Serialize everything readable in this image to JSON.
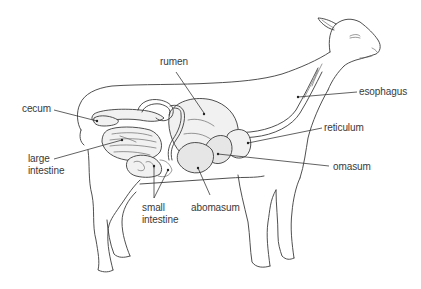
{
  "diagram": {
    "labels": [
      {
        "id": "rumen",
        "text": "rumen"
      },
      {
        "id": "esophagus",
        "text": "esophagus"
      },
      {
        "id": "cecum",
        "text": "cecum"
      },
      {
        "id": "reticulum",
        "text": "reticulum"
      },
      {
        "id": "large_intestine_1",
        "text": "large"
      },
      {
        "id": "large_intestine_2",
        "text": "intestine"
      },
      {
        "id": "omasum",
        "text": "omasum"
      },
      {
        "id": "small_intestine_1",
        "text": "small"
      },
      {
        "id": "small_intestine_2",
        "text": "intestine"
      },
      {
        "id": "abomasum",
        "text": "abomasum"
      }
    ],
    "colors": {
      "line": "#3c3c3c",
      "text": "#3a3a3a",
      "background": "#ffffff"
    }
  }
}
